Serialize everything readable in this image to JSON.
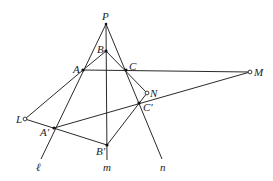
{
  "figure": {
    "points": {
      "P": {
        "label": "P",
        "x": 106,
        "y": 24
      },
      "B": {
        "label": "B",
        "x": 106,
        "y": 51
      },
      "A": {
        "label": "A",
        "x": 83,
        "y": 70
      },
      "C": {
        "label": "C",
        "x": 126,
        "y": 70
      },
      "M": {
        "label": "M",
        "x": 250,
        "y": 72
      },
      "N": {
        "label": "N",
        "x": 147,
        "y": 93
      },
      "C2": {
        "label": "C'",
        "x": 139,
        "y": 103
      },
      "L": {
        "label": "L",
        "x": 25,
        "y": 119
      },
      "A2": {
        "label": "A'",
        "x": 54,
        "y": 128
      },
      "B2": {
        "label": "B'",
        "x": 107,
        "y": 145
      }
    },
    "lines": {
      "l": {
        "label": "ℓ"
      },
      "m": {
        "label": "m"
      },
      "n": {
        "label": "n"
      }
    }
  }
}
